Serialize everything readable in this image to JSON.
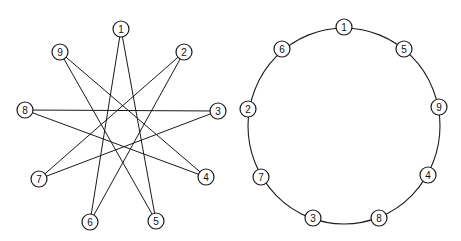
{
  "diagrams": [
    {
      "name": "star-polygon",
      "description": "Nine numbered nodes arranged on a circle connected as a {9/4} star polygon",
      "node_radius": 8,
      "nodes": [
        {
          "id": "1",
          "x": 121,
          "y": 29
        },
        {
          "id": "2",
          "x": 184,
          "y": 52
        },
        {
          "id": "3",
          "x": 218,
          "y": 111
        },
        {
          "id": "4",
          "x": 206,
          "y": 177
        },
        {
          "id": "5",
          "x": 156,
          "y": 221
        },
        {
          "id": "6",
          "x": 90,
          "y": 222
        },
        {
          "id": "7",
          "x": 39,
          "y": 179
        },
        {
          "id": "8",
          "x": 25,
          "y": 110
        },
        {
          "id": "9",
          "x": 60,
          "y": 52
        }
      ],
      "edges": [
        [
          "1",
          "5"
        ],
        [
          "5",
          "9"
        ],
        [
          "9",
          "4"
        ],
        [
          "4",
          "8"
        ],
        [
          "8",
          "3"
        ],
        [
          "3",
          "7"
        ],
        [
          "7",
          "2"
        ],
        [
          "2",
          "6"
        ],
        [
          "6",
          "1"
        ]
      ]
    },
    {
      "name": "cycle-ring",
      "description": "The same nine nodes reordered along a single circle in cycle order",
      "ring": {
        "cx": 344,
        "cy": 126,
        "rx": 96,
        "ry": 98
      },
      "node_radius": 8,
      "nodes": [
        {
          "id": "1",
          "x": 344,
          "y": 27
        },
        {
          "id": "5",
          "x": 404,
          "y": 49
        },
        {
          "id": "9",
          "x": 439,
          "y": 107
        },
        {
          "id": "4",
          "x": 428,
          "y": 175
        },
        {
          "id": "8",
          "x": 379,
          "y": 218
        },
        {
          "id": "3",
          "x": 313,
          "y": 218
        },
        {
          "id": "7",
          "x": 261,
          "y": 177
        },
        {
          "id": "2",
          "x": 248,
          "y": 109
        },
        {
          "id": "6",
          "x": 282,
          "y": 49
        }
      ]
    }
  ],
  "colors": {
    "stroke": "#1a1a1a",
    "node_fill": "#ffffff",
    "background": "#ffffff"
  }
}
